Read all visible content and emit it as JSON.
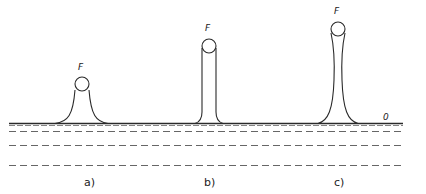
{
  "figure": {
    "surface_label": "0",
    "colors": {
      "stroke": "#2a2a2a",
      "dash": "#555555",
      "background": "#ffffff"
    },
    "panels": [
      {
        "id": "a",
        "caption": "a)",
        "force_label": "F",
        "shape": "low wide meniscus"
      },
      {
        "id": "b",
        "caption": "b)",
        "force_label": "F",
        "shape": "tall straight column"
      },
      {
        "id": "c",
        "caption": "c)",
        "force_label": "F",
        "shape": "tallest necking column"
      }
    ]
  }
}
